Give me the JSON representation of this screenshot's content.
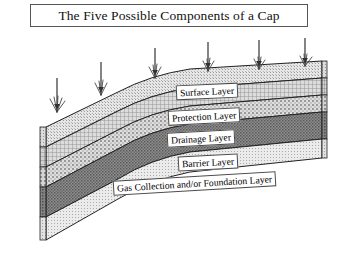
{
  "title": {
    "text": "The Five Possible Components of a Cap"
  },
  "diagram": {
    "name": "landfill-cap-cross-section",
    "layers": [
      {
        "id": "surface",
        "label": "Surface Layer",
        "fill": "#e3e3e3",
        "pattern": "fine-stipple"
      },
      {
        "id": "protection",
        "label": "Protection Layer",
        "fill": "#cfcfcf",
        "pattern": "cross-hatch-grid"
      },
      {
        "id": "drainage",
        "label": "Drainage Layer",
        "fill": "#d8d8d8",
        "pattern": "coarse-dots"
      },
      {
        "id": "barrier",
        "label": "Barrier Layer",
        "fill": "#8a8a8a",
        "pattern": "dark-dense-hatch"
      },
      {
        "id": "gas",
        "label": "Gas Collection and/or Foundation Layer",
        "fill": "#e8e8e8",
        "pattern": "light-stipple"
      }
    ],
    "infiltration_arrows": {
      "count": 6,
      "direction": "down",
      "meaning": "precipitation-infiltration"
    },
    "grass_tufts": {
      "count": 6,
      "meaning": "vegetation-on-surface-layer"
    },
    "outline_color": "#222222",
    "background": "#ffffff"
  }
}
